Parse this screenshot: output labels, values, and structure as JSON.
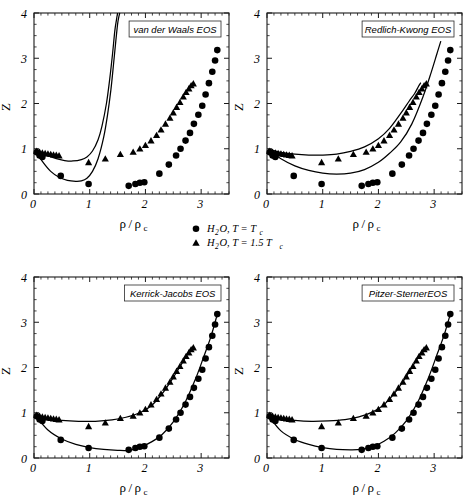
{
  "figure": {
    "background": "#ffffff",
    "ink": "#000000"
  },
  "legend": {
    "entries": [
      {
        "marker": "circle-marker",
        "label_main": "H",
        "label_sub1": "2",
        "label_mid": "O, T = T",
        "label_sub2": "c"
      },
      {
        "marker": "triangle-marker",
        "label_main": "H",
        "label_sub1": "2",
        "label_mid": "O, T = 1.5 T",
        "label_sub2": "c"
      }
    ],
    "entry_0_text": "H₂O, T = T_c",
    "entry_1_text": "H₂O, T = 1.5 T_c"
  },
  "axis_common": {
    "xlabel_num": "ρ",
    "xlabel_slash": "/",
    "xlabel_den": "ρ",
    "xlabel_sub": "c",
    "xlabel_text": "ρ/ρc",
    "ylabel_text": "Z",
    "xticks": [
      "0",
      "1",
      "2",
      "3"
    ],
    "yticks": [
      "0",
      "1",
      "2",
      "3",
      "4"
    ],
    "xlim": [
      0,
      3.5
    ],
    "ylim": [
      0,
      4
    ],
    "grid": false
  },
  "chart_data": [
    {
      "type": "scatter",
      "panel": "top-left",
      "title": "van der Waals EOS",
      "xlabel": "ρ/ρc",
      "ylabel": "Z",
      "xlim": [
        0,
        3.5
      ],
      "ylim": [
        0,
        4
      ],
      "xticks": [
        0,
        1,
        2,
        3
      ],
      "yticks": [
        0,
        1,
        2,
        3,
        4
      ],
      "grid": false,
      "legend_position": "none",
      "series": [
        {
          "name": "H2O, T = Tc",
          "marker": "circle",
          "x": [
            0.05,
            0.1,
            0.15,
            0.48,
            0.98,
            1.7,
            1.82,
            1.9,
            1.98,
            2.25,
            2.42,
            2.55,
            2.63,
            2.72,
            2.8,
            2.87,
            2.95,
            3.02,
            3.08,
            3.14,
            3.2,
            3.25,
            3.29
          ],
          "y": [
            0.92,
            0.85,
            0.82,
            0.4,
            0.22,
            0.18,
            0.22,
            0.25,
            0.26,
            0.45,
            0.65,
            0.85,
            1.0,
            1.18,
            1.35,
            1.55,
            1.75,
            1.95,
            2.2,
            2.45,
            2.7,
            2.95,
            3.18
          ]
        },
        {
          "name": "H2O, T = 1.5 Tc",
          "marker": "triangle",
          "x": [
            0.05,
            0.1,
            0.15,
            0.2,
            0.25,
            0.3,
            0.35,
            0.4,
            0.45,
            0.98,
            1.28,
            1.55,
            1.78,
            1.9,
            2.0,
            2.1,
            2.2,
            2.28,
            2.36,
            2.44,
            2.5,
            2.56,
            2.62,
            2.68,
            2.73,
            2.78,
            2.82,
            2.86
          ],
          "y": [
            0.95,
            0.93,
            0.91,
            0.9,
            0.89,
            0.88,
            0.87,
            0.86,
            0.85,
            0.7,
            0.78,
            0.88,
            0.93,
            1.0,
            1.08,
            1.18,
            1.3,
            1.42,
            1.55,
            1.68,
            1.8,
            1.92,
            2.03,
            2.15,
            2.25,
            2.33,
            2.4,
            2.44
          ]
        }
      ],
      "model_curves": [
        {
          "name": "vdW T=Tc",
          "x": [
            0.02,
            0.15,
            0.3,
            0.45,
            0.6,
            0.75,
            0.85,
            0.95,
            1.05,
            1.15,
            1.25,
            1.32,
            1.38,
            1.43,
            1.47,
            1.5,
            1.52,
            1.54
          ],
          "y": [
            0.97,
            0.72,
            0.5,
            0.37,
            0.3,
            0.28,
            0.29,
            0.35,
            0.5,
            0.78,
            1.25,
            1.75,
            2.3,
            2.9,
            3.4,
            3.75,
            3.9,
            4.0
          ]
        },
        {
          "name": "vdW T=1.5Tc",
          "x": [
            0.02,
            0.2,
            0.4,
            0.55,
            0.7,
            0.85,
            0.95,
            1.05,
            1.15,
            1.22,
            1.3,
            1.36,
            1.41,
            1.45,
            1.48,
            1.5
          ],
          "y": [
            0.98,
            0.87,
            0.78,
            0.74,
            0.73,
            0.76,
            0.82,
            0.95,
            1.2,
            1.5,
            2.0,
            2.55,
            3.1,
            3.6,
            3.85,
            4.0
          ]
        }
      ]
    },
    {
      "type": "scatter",
      "panel": "top-right",
      "title": "Redlich-Kwong EOS",
      "xlabel": "ρ/ρc",
      "ylabel": "Z",
      "xlim": [
        0,
        3.5
      ],
      "ylim": [
        0,
        4
      ],
      "xticks": [
        0,
        1,
        2,
        3
      ],
      "yticks": [
        0,
        1,
        2,
        3,
        4
      ],
      "grid": false,
      "legend_position": "none",
      "series": [
        {
          "name": "H2O, T = Tc",
          "marker": "circle",
          "x": [
            0.05,
            0.1,
            0.15,
            0.48,
            0.98,
            1.7,
            1.82,
            1.9,
            1.98,
            2.25,
            2.42,
            2.55,
            2.63,
            2.72,
            2.8,
            2.87,
            2.95,
            3.02,
            3.08,
            3.14,
            3.2,
            3.25,
            3.29
          ],
          "y": [
            0.92,
            0.85,
            0.82,
            0.4,
            0.22,
            0.18,
            0.22,
            0.25,
            0.26,
            0.45,
            0.65,
            0.85,
            1.0,
            1.18,
            1.35,
            1.55,
            1.75,
            1.95,
            2.2,
            2.45,
            2.7,
            2.95,
            3.18
          ]
        },
        {
          "name": "H2O, T = 1.5 Tc",
          "marker": "triangle",
          "x": [
            0.05,
            0.1,
            0.15,
            0.2,
            0.25,
            0.3,
            0.35,
            0.4,
            0.45,
            0.98,
            1.28,
            1.55,
            1.78,
            1.9,
            2.0,
            2.1,
            2.2,
            2.28,
            2.36,
            2.44,
            2.5,
            2.56,
            2.62,
            2.68,
            2.73,
            2.78,
            2.82,
            2.86
          ],
          "y": [
            0.95,
            0.93,
            0.91,
            0.9,
            0.89,
            0.88,
            0.87,
            0.86,
            0.85,
            0.7,
            0.78,
            0.88,
            0.93,
            1.0,
            1.08,
            1.18,
            1.3,
            1.42,
            1.55,
            1.68,
            1.8,
            1.92,
            2.03,
            2.15,
            2.25,
            2.33,
            2.4,
            2.44
          ]
        }
      ],
      "model_curves": [
        {
          "name": "RK T=Tc",
          "x": [
            0.02,
            0.25,
            0.5,
            0.75,
            1.0,
            1.25,
            1.5,
            1.75,
            2.0,
            2.2,
            2.4,
            2.6,
            2.8,
            2.95,
            3.05,
            3.12
          ],
          "y": [
            0.97,
            0.78,
            0.62,
            0.52,
            0.46,
            0.44,
            0.46,
            0.54,
            0.7,
            0.9,
            1.15,
            1.55,
            2.15,
            2.7,
            3.1,
            3.38
          ]
        },
        {
          "name": "RK T=1.5Tc",
          "x": [
            0.02,
            0.25,
            0.5,
            0.75,
            1.0,
            1.25,
            1.5,
            1.75,
            2.0,
            2.2,
            2.4,
            2.55,
            2.65,
            2.72,
            2.76
          ],
          "y": [
            0.99,
            0.92,
            0.88,
            0.86,
            0.86,
            0.88,
            0.94,
            1.04,
            1.22,
            1.45,
            1.78,
            2.05,
            2.22,
            2.38,
            2.46
          ]
        }
      ]
    },
    {
      "type": "scatter",
      "panel": "bottom-left",
      "title": "Kerrick-Jacobs EOS",
      "xlabel": "ρ/ρc",
      "ylabel": "Z",
      "xlim": [
        0,
        3.5
      ],
      "ylim": [
        0,
        4
      ],
      "xticks": [
        0,
        1,
        2,
        3
      ],
      "yticks": [
        0,
        1,
        2,
        3,
        4
      ],
      "grid": false,
      "legend_position": "none",
      "series": [
        {
          "name": "H2O, T = Tc",
          "marker": "circle",
          "x": [
            0.05,
            0.1,
            0.15,
            0.48,
            0.98,
            1.7,
            1.82,
            1.9,
            1.98,
            2.25,
            2.42,
            2.55,
            2.63,
            2.72,
            2.8,
            2.87,
            2.95,
            3.02,
            3.08,
            3.14,
            3.2,
            3.25,
            3.29
          ],
          "y": [
            0.92,
            0.85,
            0.82,
            0.4,
            0.22,
            0.18,
            0.22,
            0.25,
            0.26,
            0.45,
            0.65,
            0.85,
            1.0,
            1.18,
            1.35,
            1.55,
            1.75,
            1.95,
            2.2,
            2.45,
            2.7,
            2.95,
            3.18
          ]
        },
        {
          "name": "H2O, T = 1.5 Tc",
          "marker": "triangle",
          "x": [
            0.05,
            0.1,
            0.15,
            0.2,
            0.25,
            0.3,
            0.35,
            0.4,
            0.45,
            0.98,
            1.28,
            1.55,
            1.78,
            1.9,
            2.0,
            2.1,
            2.2,
            2.28,
            2.36,
            2.44,
            2.5,
            2.56,
            2.62,
            2.68,
            2.73,
            2.78,
            2.82,
            2.86
          ],
          "y": [
            0.95,
            0.93,
            0.91,
            0.9,
            0.89,
            0.88,
            0.87,
            0.86,
            0.85,
            0.7,
            0.78,
            0.88,
            0.93,
            1.0,
            1.08,
            1.18,
            1.3,
            1.42,
            1.55,
            1.68,
            1.8,
            1.92,
            2.03,
            2.15,
            2.25,
            2.33,
            2.4,
            2.44
          ]
        }
      ],
      "model_curves": [
        {
          "name": "KJ T=Tc",
          "x": [
            0.02,
            0.25,
            0.5,
            0.75,
            1.0,
            1.25,
            1.5,
            1.7,
            1.9,
            2.1,
            2.3,
            2.5,
            2.7,
            2.9,
            3.05,
            3.18,
            3.29
          ],
          "y": [
            0.95,
            0.62,
            0.42,
            0.3,
            0.23,
            0.19,
            0.17,
            0.17,
            0.23,
            0.35,
            0.52,
            0.8,
            1.2,
            1.75,
            2.25,
            2.7,
            3.18
          ]
        },
        {
          "name": "KJ T=1.5Tc",
          "x": [
            0.02,
            0.25,
            0.5,
            0.8,
            1.1,
            1.4,
            1.65,
            1.9,
            2.1,
            2.3,
            2.5,
            2.65,
            2.78,
            2.86
          ],
          "y": [
            0.97,
            0.87,
            0.83,
            0.81,
            0.81,
            0.84,
            0.9,
            1.0,
            1.15,
            1.42,
            1.78,
            2.08,
            2.35,
            2.46
          ]
        }
      ]
    },
    {
      "type": "scatter",
      "panel": "bottom-right",
      "title": "Pitzer-SternerEOS",
      "xlabel": "ρ/ρc",
      "ylabel": "Z",
      "xlim": [
        0,
        3.5
      ],
      "ylim": [
        0,
        4
      ],
      "xticks": [
        0,
        1,
        2,
        3
      ],
      "yticks": [
        0,
        1,
        2,
        3,
        4
      ],
      "grid": false,
      "legend_position": "none",
      "series": [
        {
          "name": "H2O, T = Tc",
          "marker": "circle",
          "x": [
            0.05,
            0.1,
            0.15,
            0.48,
            0.98,
            1.7,
            1.82,
            1.9,
            1.98,
            2.25,
            2.42,
            2.55,
            2.63,
            2.72,
            2.8,
            2.87,
            2.95,
            3.02,
            3.08,
            3.14,
            3.2,
            3.25,
            3.29
          ],
          "y": [
            0.92,
            0.85,
            0.82,
            0.4,
            0.22,
            0.18,
            0.22,
            0.25,
            0.26,
            0.45,
            0.65,
            0.85,
            1.0,
            1.18,
            1.35,
            1.55,
            1.75,
            1.95,
            2.2,
            2.45,
            2.7,
            2.95,
            3.18
          ]
        },
        {
          "name": "H2O, T = 1.5 Tc",
          "marker": "triangle",
          "x": [
            0.05,
            0.1,
            0.15,
            0.2,
            0.25,
            0.3,
            0.35,
            0.4,
            0.45,
            0.98,
            1.28,
            1.55,
            1.78,
            1.9,
            2.0,
            2.1,
            2.2,
            2.28,
            2.36,
            2.44,
            2.5,
            2.56,
            2.62,
            2.68,
            2.73,
            2.78,
            2.82,
            2.86
          ],
          "y": [
            0.95,
            0.93,
            0.91,
            0.9,
            0.89,
            0.88,
            0.87,
            0.86,
            0.85,
            0.7,
            0.78,
            0.88,
            0.93,
            1.0,
            1.08,
            1.18,
            1.3,
            1.42,
            1.55,
            1.68,
            1.8,
            1.92,
            2.03,
            2.15,
            2.25,
            2.33,
            2.4,
            2.44
          ]
        }
      ],
      "model_curves": [
        {
          "name": "PS T=Tc",
          "x": [
            0.02,
            0.25,
            0.5,
            0.75,
            1.0,
            1.25,
            1.5,
            1.7,
            1.9,
            2.1,
            2.3,
            2.5,
            2.7,
            2.9,
            3.05,
            3.18,
            3.29
          ],
          "y": [
            0.95,
            0.6,
            0.41,
            0.3,
            0.23,
            0.19,
            0.18,
            0.19,
            0.25,
            0.37,
            0.55,
            0.82,
            1.22,
            1.78,
            2.28,
            2.72,
            3.18
          ]
        },
        {
          "name": "PS T=1.5Tc",
          "x": [
            0.02,
            0.25,
            0.5,
            0.8,
            1.1,
            1.4,
            1.65,
            1.9,
            2.1,
            2.3,
            2.5,
            2.65,
            2.78,
            2.86
          ],
          "y": [
            0.97,
            0.87,
            0.83,
            0.81,
            0.82,
            0.85,
            0.91,
            1.02,
            1.18,
            1.45,
            1.8,
            2.1,
            2.35,
            2.45
          ]
        }
      ]
    }
  ]
}
